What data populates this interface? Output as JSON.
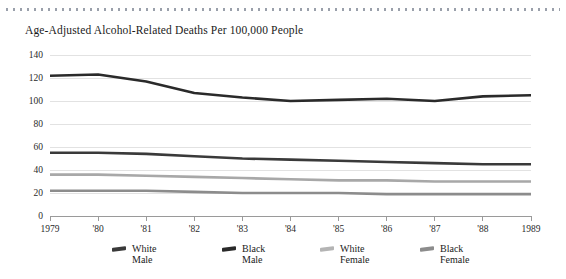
{
  "chart_data": {
    "type": "line",
    "title": "Age-Adjusted Alcohol-Related Deaths Per 100,000 People",
    "xlabel": "",
    "ylabel": "",
    "ylim": [
      0,
      140
    ],
    "yticks": [
      0,
      20,
      40,
      60,
      80,
      100,
      120,
      140
    ],
    "ytick_labels": [
      "0",
      "20",
      "40",
      "60",
      "80",
      "100",
      "120",
      "140"
    ],
    "grid": true,
    "legend_position": "bottom",
    "x": [
      1979,
      1980,
      1981,
      1982,
      1983,
      1984,
      1985,
      1986,
      1987,
      1988,
      1989
    ],
    "xtick_labels": [
      "1979",
      "'80",
      "'81",
      "'82",
      "'83",
      "'84",
      "'85",
      "'86",
      "'87",
      "'88",
      "1989"
    ],
    "series": [
      {
        "name": "Black Male",
        "color": "#2a2a2a",
        "values": [
          122,
          123,
          117,
          107,
          103,
          100,
          101,
          102,
          100,
          104,
          105
        ]
      },
      {
        "name": "White Male",
        "color": "#3a3a3a",
        "values": [
          55,
          55,
          54,
          52,
          50,
          49,
          48,
          47,
          46,
          45,
          45
        ]
      },
      {
        "name": "White Female",
        "color": "#a8a8a8",
        "values": [
          36,
          36,
          35,
          34,
          33,
          32,
          31,
          31,
          30,
          30,
          30
        ]
      },
      {
        "name": "Black Female",
        "color": "#8c8c8c",
        "values": [
          22,
          22,
          22,
          21,
          20,
          20,
          20,
          19,
          19,
          19,
          19
        ]
      }
    ]
  },
  "legend": {
    "items": [
      {
        "line1": "White",
        "line2": "Male",
        "color": "#3a3a3a"
      },
      {
        "line1": "Black",
        "line2": "Male",
        "color": "#2a2a2a"
      },
      {
        "line1": "White",
        "line2": "Female",
        "color": "#b4b4b4"
      },
      {
        "line1": "Black",
        "line2": "Female",
        "color": "#8c8c8c"
      }
    ]
  }
}
